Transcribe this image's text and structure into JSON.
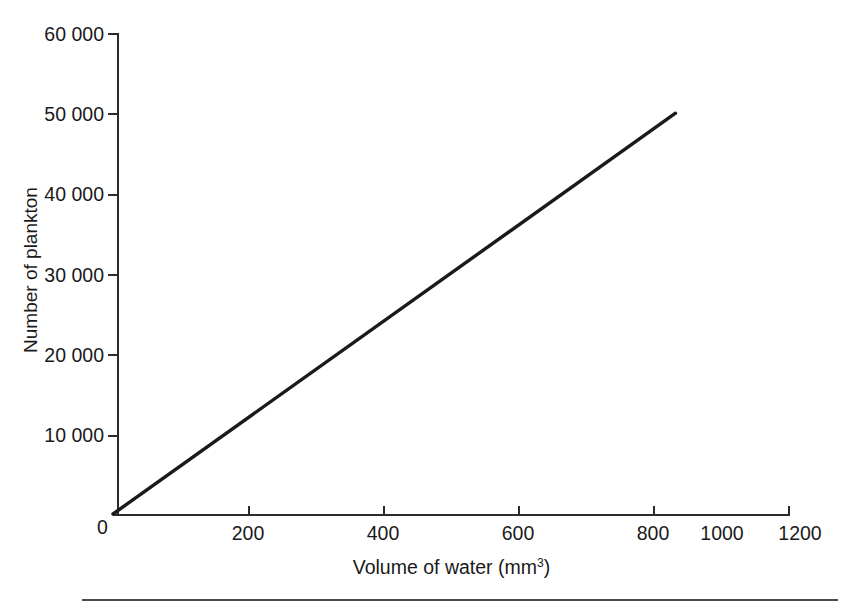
{
  "chart_data": {
    "type": "line",
    "title": "",
    "xlabel": "Volume of water (mm3)",
    "xlabel_base": "Volume of water (mm",
    "xlabel_sup": "3",
    "xlabel_close": ")",
    "ylabel": "Number of plankton",
    "xlim": [
      0,
      1200
    ],
    "ylim": [
      0,
      60000
    ],
    "grid": false,
    "legend": null,
    "x_ticks": [
      0,
      200,
      400,
      600,
      800,
      1000,
      1200
    ],
    "x_tick_labels": [
      "0",
      "200",
      "400",
      "600",
      "800",
      "1000",
      "1200"
    ],
    "y_ticks": [
      0,
      10000,
      20000,
      30000,
      40000,
      50000,
      60000
    ],
    "y_tick_labels": [
      "0",
      "10 000",
      "20 000",
      "30 000",
      "40 000",
      "50 000",
      "60 000"
    ],
    "series": [
      {
        "name": "plankton count",
        "x": [
          0,
          1000
        ],
        "y": [
          0,
          50000
        ],
        "color": "#1a1a1a",
        "line_width": 3,
        "slope_per_mm3": 50
      }
    ],
    "annotations": []
  },
  "axes": {
    "y_title": "Number of plankton",
    "x_title_base": "Volume of water (mm",
    "x_title_sup": "3",
    "x_title_close": ")",
    "origin_label": "0"
  },
  "colors": {
    "data_line": "#1a1a1a",
    "axis": "#2b2b2b",
    "background": "#ffffff",
    "rule": "#4a4a4a"
  }
}
